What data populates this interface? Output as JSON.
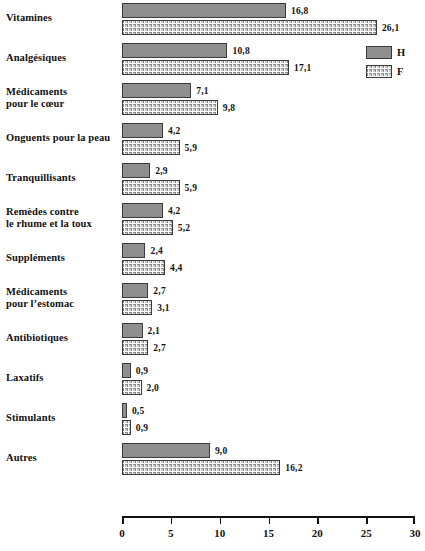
{
  "chart_data": {
    "type": "bar",
    "orientation": "horizontal",
    "title": "",
    "xlabel": "",
    "ylabel": "",
    "xlim": [
      0,
      30
    ],
    "xticks": [
      0,
      5,
      10,
      15,
      20,
      25,
      30
    ],
    "xtick_labels": [
      "0",
      "5",
      "10",
      "15",
      "20",
      "25",
      "30"
    ],
    "grid": false,
    "legend_position": "top-right",
    "categories": [
      "Vitamines",
      "Analgésiques",
      "Médicaments\npour le cœur",
      "Onguents pour la peau",
      "Tranquillisants",
      "Remèdes contre\nle rhume et la toux",
      "Suppléments",
      "Médicaments\npour l’estomac",
      "Antibiotiques",
      "Laxatifs",
      "Stimulants",
      "Autres"
    ],
    "series": [
      {
        "name": "H",
        "color": "#8f8f8f",
        "pattern": "solid",
        "values": [
          16.8,
          10.8,
          7.1,
          4.2,
          2.9,
          4.2,
          2.4,
          2.7,
          2.1,
          0.9,
          0.5,
          9.0
        ],
        "value_labels": [
          "16,8",
          "10,8",
          "7,1",
          "4,2",
          "2,9",
          "4,2",
          "2,4",
          "2,7",
          "2,1",
          "0,9",
          "0,5",
          "9,0"
        ]
      },
      {
        "name": "F",
        "color": "#d0d0d0",
        "pattern": "cross-hatch",
        "values": [
          26.1,
          17.1,
          9.8,
          5.9,
          5.9,
          5.2,
          4.4,
          3.1,
          2.7,
          2.0,
          0.9,
          16.2
        ],
        "value_labels": [
          "26,1",
          "17,1",
          "9,8",
          "5,9",
          "5,9",
          "5,2",
          "4,4",
          "3,1",
          "2,7",
          "2,0",
          "0,9",
          "16,2"
        ]
      }
    ]
  },
  "legend": {
    "items": [
      {
        "label": "H"
      },
      {
        "label": "F"
      }
    ]
  },
  "axis": {
    "tick_labels": [
      "0",
      "5",
      "10",
      "15",
      "20",
      "25",
      "30"
    ]
  }
}
